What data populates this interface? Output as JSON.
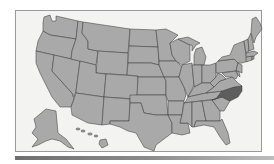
{
  "map": {
    "type": "us-states-locator",
    "highlighted_state": "North Carolina",
    "colors": {
      "background": "#f3f3f2",
      "state_fill": "#a9a9a9",
      "highlight_fill": "#5e5e5e",
      "border": "#3f3f3f",
      "frame_border": "#9a9a9a"
    },
    "insets": [
      "Alaska",
      "Hawaii"
    ]
  }
}
